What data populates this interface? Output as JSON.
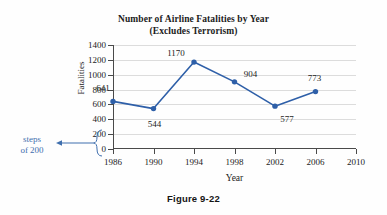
{
  "chart_data": {
    "type": "line",
    "title": "Number of Airline Fatalities by Year",
    "subtitle": "(Excludes Terrorism)",
    "xlabel": "Year",
    "ylabel": "Fatalities",
    "x": [
      1986,
      1990,
      1994,
      1998,
      2002,
      2006
    ],
    "values": [
      641,
      544,
      1170,
      904,
      577,
      773
    ],
    "point_labels": [
      "641",
      "544",
      "1170",
      "904",
      "577",
      "773"
    ],
    "xticks": [
      1986,
      1990,
      1994,
      1998,
      2002,
      2006,
      2010
    ],
    "xtick_labels": [
      "1986",
      "1990",
      "1994",
      "1998",
      "2002",
      "2006",
      "2010"
    ],
    "yticks": [
      0,
      200,
      400,
      600,
      800,
      1000,
      1200,
      1400
    ],
    "ytick_labels": [
      "0",
      "200",
      "400",
      "600",
      "800",
      "1000",
      "1200",
      "1400"
    ],
    "xlim": [
      1986,
      2010
    ],
    "ylim": [
      0,
      1400
    ],
    "ystep": 200,
    "grid": "horizontal",
    "legend": "none",
    "series_color": "#2E5FA8",
    "marker": "circle"
  },
  "annotation": {
    "line1": "steps",
    "line2": "of 200",
    "color": "#3f6fae",
    "points_to_ticks": [
      "0",
      "200"
    ]
  },
  "caption": {
    "text": "Figure 9-22"
  },
  "colors": {
    "series": "#2E5FA8",
    "gridline": "#dcdcdc",
    "axis": "#4a4a4a",
    "text": "#1c1c1c",
    "annotation": "#3f6fae",
    "background": "#fefefe"
  }
}
